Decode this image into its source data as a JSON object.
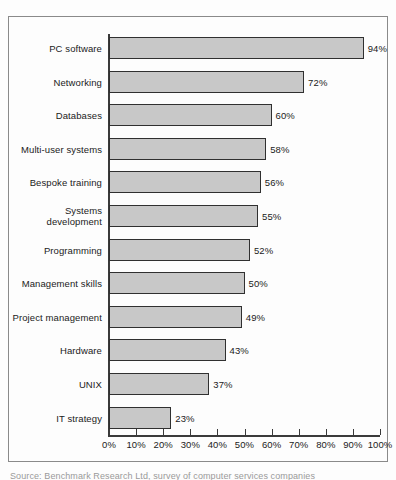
{
  "document": {
    "background_color": "#fdfdfd",
    "frame_border_color": "#8a8a8a",
    "caption": "Source: Benchmark Research Ltd, survey of computer services companies"
  },
  "chart_data": {
    "type": "bar",
    "orientation": "horizontal",
    "title": "",
    "subtitle": "",
    "xlabel": "",
    "ylabel": "",
    "xlim": [
      0,
      100
    ],
    "grid": false,
    "legend": false,
    "bar_fill_color": "#c8c8c8",
    "bar_border_color": "#303030",
    "axis_color": "#3a3a3a",
    "value_suffix": "%",
    "categories": [
      "PC software",
      "Networking",
      "Databases",
      "Multi-user systems",
      "Bespoke training",
      "Systems\ndevelopment",
      "Programming",
      "Management skills",
      "Project management",
      "Hardware",
      "UNIX",
      "IT strategy"
    ],
    "values": [
      94,
      72,
      60,
      58,
      56,
      55,
      52,
      50,
      49,
      43,
      37,
      23
    ],
    "value_labels": [
      "94%",
      "72%",
      "60%",
      "58%",
      "56%",
      "55%",
      "52%",
      "50%",
      "49%",
      "43%",
      "37%",
      "23%"
    ],
    "x_ticks": [
      0,
      10,
      20,
      30,
      40,
      50,
      60,
      70,
      80,
      90,
      100
    ],
    "x_tick_labels": [
      "0%",
      "10%",
      "20%",
      "30%",
      "40%",
      "50%",
      "60%",
      "70%",
      "80%",
      "90%",
      "100%"
    ]
  }
}
